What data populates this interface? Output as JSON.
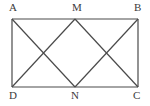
{
  "figure": {
    "kind": "geometry-diagram",
    "background_color": "#ffffff",
    "stroke_color": "#4a4a4a",
    "label_color": "#3b3b3b",
    "stroke_width": 1.2,
    "points": {
      "A": {
        "label": "A",
        "x": 12,
        "y": 19
      },
      "M": {
        "label": "M",
        "x": 75,
        "y": 19
      },
      "B": {
        "label": "B",
        "x": 138,
        "y": 19
      },
      "D": {
        "label": "D",
        "x": 12,
        "y": 87
      },
      "N": {
        "label": "N",
        "x": 75,
        "y": 87
      },
      "C": {
        "label": "C",
        "x": 138,
        "y": 87
      }
    },
    "segments": [
      {
        "name": "top-edge-AB",
        "from": "A",
        "to": "B"
      },
      {
        "name": "bottom-edge-DC",
        "from": "D",
        "to": "C"
      },
      {
        "name": "left-edge-AD",
        "from": "A",
        "to": "D"
      },
      {
        "name": "right-edge-BC",
        "from": "B",
        "to": "C"
      },
      {
        "name": "diagonal-AN",
        "from": "A",
        "to": "N"
      },
      {
        "name": "diagonal-DM",
        "from": "D",
        "to": "M"
      },
      {
        "name": "diagonal-MC",
        "from": "M",
        "to": "C"
      },
      {
        "name": "diagonal-NB",
        "from": "N",
        "to": "B"
      }
    ],
    "label_order": [
      "A",
      "M",
      "B",
      "D",
      "N",
      "C"
    ]
  }
}
